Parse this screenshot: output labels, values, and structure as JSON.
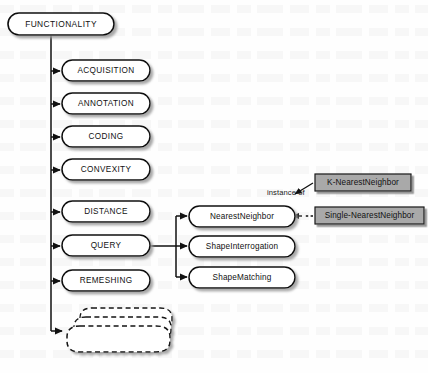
{
  "diagram": {
    "root": {
      "id": "functionality",
      "label": "FUNCTIONALITY",
      "shape": "rounded-rectangle",
      "fill": "#ffffff",
      "stroke": "#111111"
    },
    "style": {
      "node_fill": "#ffffff",
      "node_stroke": "#111111",
      "instance_fill": "#a9a9a9",
      "instance_stroke": "#1a1a1a",
      "edge_color": "#111111",
      "shadow_color": "#b4b4b4",
      "background": "#fefefe"
    },
    "categories": [
      {
        "id": "acquisition",
        "label": "ACQUISITION"
      },
      {
        "id": "annotation",
        "label": "ANNOTATION"
      },
      {
        "id": "coding",
        "label": "CODING"
      },
      {
        "id": "convexity",
        "label": "CONVEXITY"
      },
      {
        "id": "distance",
        "label": "DISTANCE"
      },
      {
        "id": "query",
        "label": "QUERY"
      },
      {
        "id": "remeshing",
        "label": "REMESHING"
      }
    ],
    "more_nodes": {
      "id": "more-stack",
      "label": "",
      "shape": "dashed-stack",
      "description": "stack of dashed rounded rectangles indicating additional categories"
    },
    "query_children": [
      {
        "id": "nearest-neighbor",
        "label": "NearestNeighbor"
      },
      {
        "id": "shape-interrogation",
        "label": "ShapeInterrogation"
      },
      {
        "id": "shape-matching",
        "label": "ShapeMatching"
      }
    ],
    "instances": [
      {
        "id": "k-nearest-neighbor",
        "label": "K-NearestNeighbor",
        "shape": "rectangle"
      },
      {
        "id": "single-nearest-neighbor",
        "label": "Single-NearestNeighbor",
        "shape": "rectangle"
      }
    ],
    "edge_labels": {
      "instance_of": "instance of"
    }
  }
}
